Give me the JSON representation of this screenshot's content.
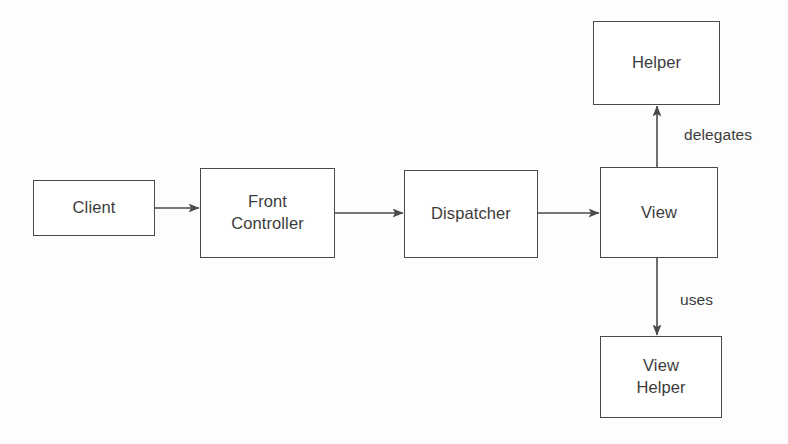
{
  "diagram": {
    "background_color": "#fdfdfd",
    "line_color": "#4a4a4a",
    "text_color": "#3c3c3c",
    "nodes": [
      {
        "id": "client",
        "label": "Client",
        "x": 33,
        "y": 180,
        "w": 122,
        "h": 56
      },
      {
        "id": "front-controller",
        "label": "Front\nController",
        "x": 200,
        "y": 168,
        "w": 135,
        "h": 90
      },
      {
        "id": "dispatcher",
        "label": "Dispatcher",
        "x": 404,
        "y": 170,
        "w": 134,
        "h": 88
      },
      {
        "id": "view",
        "label": "View",
        "x": 600,
        "y": 167,
        "w": 118,
        "h": 91
      },
      {
        "id": "helper",
        "label": "Helper",
        "x": 593,
        "y": 21,
        "w": 127,
        "h": 84
      },
      {
        "id": "view-helper",
        "label": "View\nHelper",
        "x": 600,
        "y": 336,
        "w": 122,
        "h": 82
      }
    ],
    "edges": [
      {
        "id": "client-to-front-controller",
        "from": "client",
        "to": "front-controller",
        "label": "",
        "direction": "right"
      },
      {
        "id": "front-controller-to-dispatcher",
        "from": "front-controller",
        "to": "dispatcher",
        "label": "",
        "direction": "right"
      },
      {
        "id": "dispatcher-to-view",
        "from": "dispatcher",
        "to": "view",
        "label": "",
        "direction": "right"
      },
      {
        "id": "view-to-helper",
        "from": "view",
        "to": "helper",
        "label": "delegates",
        "direction": "up"
      },
      {
        "id": "view-to-view-helper",
        "from": "view",
        "to": "view-helper",
        "label": "uses",
        "direction": "down"
      }
    ],
    "edge_labels": {
      "delegates": {
        "text": "delegates",
        "x": 684,
        "y": 127
      },
      "uses": {
        "text": "uses",
        "x": 680,
        "y": 292
      }
    }
  }
}
